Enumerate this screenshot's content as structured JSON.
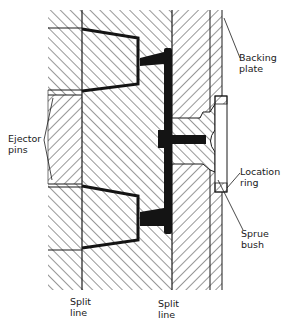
{
  "figure": {
    "labels": {
      "backing_plate": [
        "Backing",
        "plate"
      ],
      "ejector_pins": [
        "Ejector",
        "pins"
      ],
      "location_ring": [
        "Location",
        "ring"
      ],
      "sprue_bush": [
        "Sprue",
        "bush"
      ],
      "split_line_left": [
        "Split",
        "line"
      ],
      "split_line_right": [
        "Split",
        "line"
      ]
    },
    "colors": {
      "ink": "#1a1a1a",
      "background": "#ffffff",
      "runner_fill": "#141414"
    }
  }
}
